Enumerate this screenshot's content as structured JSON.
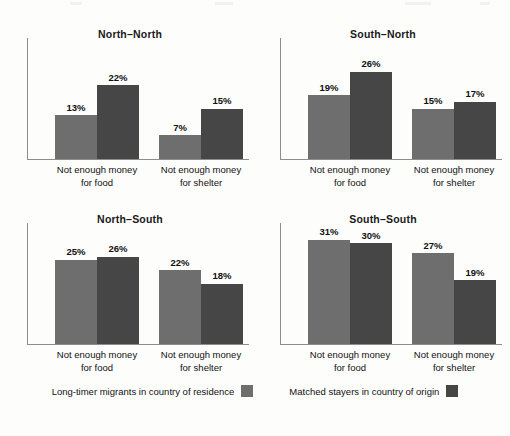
{
  "chart_data": {
    "type": "bar",
    "title": "",
    "categories": [
      "Not enough money for food",
      "Not enough money for shelter"
    ],
    "series": [
      {
        "name": "Long-timer migrants in country of residence",
        "color": "#6e6e6e"
      },
      {
        "name": "Matched stayers in country of origin",
        "color": "#464646"
      }
    ],
    "ylim": [
      0,
      36
    ],
    "ylabel": "",
    "xlabel": "",
    "grid": false,
    "legend_position": "bottom",
    "value_suffix": "%",
    "panels": [
      {
        "title": "North–North",
        "groups": [
          {
            "label_line1": "Not enough money",
            "label_line2": "for food",
            "bars": [
              {
                "series": "Long-timer migrants in country of residence",
                "value": 13,
                "label": "13%"
              },
              {
                "series": "Matched stayers in country of origin",
                "value": 22,
                "label": "22%"
              }
            ]
          },
          {
            "label_line1": "Not enough money",
            "label_line2": "for shelter",
            "bars": [
              {
                "series": "Long-timer migrants in country of residence",
                "value": 7,
                "label": "7%"
              },
              {
                "series": "Matched stayers in country of origin",
                "value": 15,
                "label": "15%"
              }
            ]
          }
        ]
      },
      {
        "title": "South–North",
        "groups": [
          {
            "label_line1": "Not enough money",
            "label_line2": "for food",
            "bars": [
              {
                "series": "Long-timer migrants in country of residence",
                "value": 19,
                "label": "19%"
              },
              {
                "series": "Matched stayers in country of origin",
                "value": 26,
                "label": "26%"
              }
            ]
          },
          {
            "label_line1": "Not enough money",
            "label_line2": "for shelter",
            "bars": [
              {
                "series": "Long-timer migrants in country of residence",
                "value": 15,
                "label": "15%"
              },
              {
                "series": "Matched stayers in country of origin",
                "value": 17,
                "label": "17%"
              }
            ]
          }
        ]
      },
      {
        "title": "North–South",
        "groups": [
          {
            "label_line1": "Not enough money",
            "label_line2": "for food",
            "bars": [
              {
                "series": "Long-timer migrants in country of residence",
                "value": 25,
                "label": "25%"
              },
              {
                "series": "Matched stayers in country of origin",
                "value": 26,
                "label": "26%"
              }
            ]
          },
          {
            "label_line1": "Not enough money",
            "label_line2": "for shelter",
            "bars": [
              {
                "series": "Long-timer migrants in country of residence",
                "value": 22,
                "label": "22%"
              },
              {
                "series": "Matched stayers in country of origin",
                "value": 18,
                "label": "18%"
              }
            ]
          }
        ]
      },
      {
        "title": "South–South",
        "groups": [
          {
            "label_line1": "Not enough money",
            "label_line2": "for food",
            "bars": [
              {
                "series": "Long-timer migrants in country of residence",
                "value": 31,
                "label": "31%"
              },
              {
                "series": "Matched stayers in country of origin",
                "value": 30,
                "label": "30%"
              }
            ]
          },
          {
            "label_line1": "Not enough money",
            "label_line2": "for shelter",
            "bars": [
              {
                "series": "Long-timer migrants in country of residence",
                "value": 27,
                "label": "27%"
              },
              {
                "series": "Matched stayers in country of origin",
                "value": 19,
                "label": "19%"
              }
            ]
          }
        ]
      }
    ],
    "legend": [
      {
        "label": "Long-timer migrants in country of residence",
        "color": "#6e6e6e"
      },
      {
        "label": "Matched stayers in country of origin",
        "color": "#464646"
      }
    ]
  }
}
